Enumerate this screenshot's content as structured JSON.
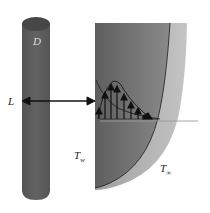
{
  "diagram": {
    "type": "physical-schematic",
    "labels": {
      "diameter": "D",
      "distance": "L",
      "wall_temperature": "T",
      "wall_temperature_sub": "w",
      "ambient_temperature": "T",
      "ambient_temperature_sub": "∞"
    },
    "colors": {
      "cylinder_body": "#5a5a5a",
      "cylinder_top": "#4a4a4a",
      "wall_dark": "#6e6e6e",
      "wall_light": "#a8a8a8",
      "boundary_layer": "#b5b5b5",
      "line": "#1a1a1a",
      "ambient_line": "#9a9a9a"
    },
    "velocity_arrows": 8
  }
}
